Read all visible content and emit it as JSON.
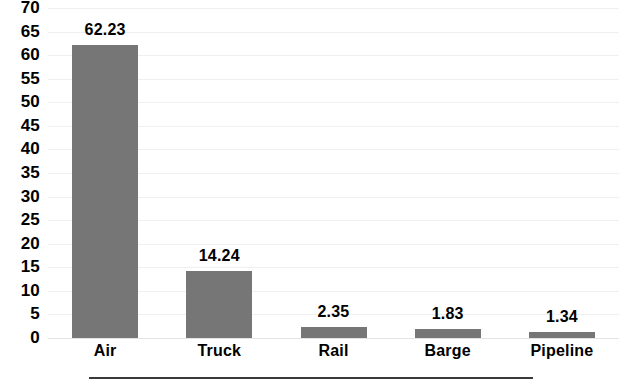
{
  "chart_data": {
    "type": "bar",
    "title": "",
    "subtitle": "",
    "xlabel": "",
    "ylabel": "",
    "categories": [
      "Air",
      "Truck",
      "Rail",
      "Barge",
      "Pipeline"
    ],
    "values": [
      62.23,
      14.24,
      2.35,
      1.83,
      1.34
    ],
    "value_labels": [
      "62.23",
      "14.24",
      "2.35",
      "1.83",
      "1.34"
    ],
    "series": [
      {
        "name": "",
        "values": [
          62.23,
          14.24,
          2.35,
          1.83,
          1.34
        ]
      }
    ],
    "ylim": [
      0,
      70
    ],
    "ytick_step": 5,
    "yticks": [
      70,
      65,
      60,
      55,
      50,
      45,
      40,
      35,
      30,
      25,
      20,
      15,
      10,
      5,
      0
    ],
    "ytick_labels": [
      "70",
      "65",
      "60",
      "55",
      "50",
      "45",
      "40",
      "35",
      "30",
      "25",
      "20",
      "15",
      "10",
      "5",
      "0"
    ],
    "grid": true,
    "grid_axis": "y",
    "legend": false,
    "legend_position": "none",
    "data_labels": true,
    "annotations": []
  },
  "style": {
    "bar_color": "#767676",
    "text_color": "#000000",
    "gridline_color": "#f0f0f0",
    "baseline_color": "#e4e4e4",
    "rule_color": "#3a3a3a",
    "background": "#ffffff"
  }
}
